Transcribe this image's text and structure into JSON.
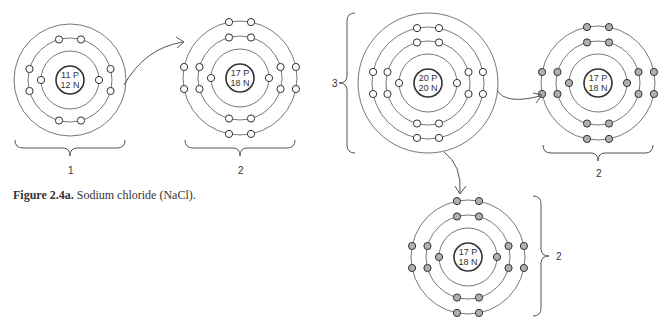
{
  "figure": {
    "caption_label": "Figure 2.4a.",
    "caption_text": " Sodium chloride (NaCl)."
  },
  "atoms": [
    {
      "id": "sodium",
      "cx": 70,
      "cy": 80,
      "protons": "11 P",
      "neutrons": "12 N",
      "label": "1",
      "shells": [
        29,
        42,
        56
      ],
      "config": [
        2,
        8,
        0
      ],
      "shaded": false
    },
    {
      "id": "chlorine-1",
      "cx": 240,
      "cy": 78,
      "protons": "17 P",
      "neutrons": "18 N",
      "label": "2",
      "shells": [
        29,
        42,
        57
      ],
      "config": [
        2,
        8,
        8
      ],
      "shaded": false
    },
    {
      "id": "calcium",
      "cx": 428,
      "cy": 83,
      "protons": "20 P",
      "neutrons": "20 N",
      "label": "3",
      "shells": [
        29,
        42,
        56,
        70
      ],
      "config": [
        2,
        8,
        8,
        0
      ],
      "shaded": false
    },
    {
      "id": "chlorine-2",
      "cx": 598,
      "cy": 83,
      "protons": "17 P",
      "neutrons": "18 N",
      "label": "2",
      "shells": [
        29,
        42,
        57
      ],
      "config": [
        2,
        8,
        8
      ],
      "shaded": true
    },
    {
      "id": "chlorine-3",
      "cx": 468,
      "cy": 257,
      "protons": "17 P",
      "neutrons": "18 N",
      "label": "2",
      "shells": [
        29,
        42,
        57
      ],
      "config": [
        2,
        8,
        8
      ],
      "shaded": true
    }
  ],
  "labels": {
    "label_1": "1",
    "label_2a": "2",
    "label_3": "3",
    "label_2b": "2",
    "label_2c": "2"
  },
  "colors": {
    "line": "#555555",
    "shaded_electron": "#b0b0b0"
  }
}
